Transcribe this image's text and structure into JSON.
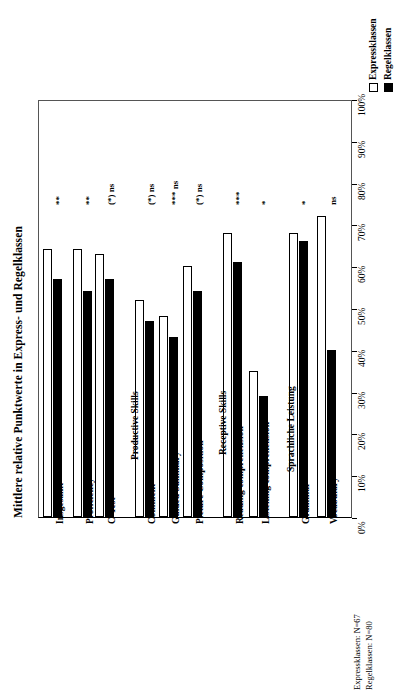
{
  "chart_data": {
    "type": "bar",
    "title": "",
    "ylabel": "Mittlere relative Punktwerte in Express- und Regelklassen",
    "xlabel": "",
    "orientation": "vertical-rotated",
    "ylim": [
      0,
      100
    ],
    "grid": false,
    "tick_labels": [
      "0%",
      "10%",
      "20%",
      "30%",
      "40%",
      "50%",
      "60%",
      "70%",
      "80%",
      "90%",
      "100%"
    ],
    "legend_position": "top-right",
    "categories": [
      "Insgesamt",
      "Proficiency",
      "C-Test",
      "Comment",
      "Guided Summary",
      "Picture Composition",
      "Reading comprehension",
      "Listening comprehension",
      "Grammar",
      "Vocabulary"
    ],
    "series": [
      {
        "name": "Expressklassen",
        "color": "#ffffff",
        "values": [
          64,
          64,
          63,
          52,
          48,
          60,
          68,
          35,
          68,
          72
        ]
      },
      {
        "name": "Regelklassen",
        "color": "#000000",
        "values": [
          57,
          54,
          57,
          47,
          43,
          54,
          61,
          29,
          66,
          40
        ]
      }
    ],
    "annotations": [
      "**",
      "**",
      "(*) ns",
      "(*) ns",
      "*** ns",
      "(*) ns",
      "***",
      "*",
      "*",
      "ns",
      "*"
    ],
    "group_headers": [
      "Productive Skills",
      "Receptive Skills",
      "Sprachliche Leistung"
    ],
    "footnotes": [
      "Expressklassen: N=67",
      "Regelklassen: N=80"
    ]
  },
  "legend": {
    "items": [
      {
        "label": "Expressklassen",
        "swatch": "hollow"
      },
      {
        "label": "Regelklassen",
        "swatch": "filled"
      }
    ]
  },
  "axis": {
    "title": "Mittlere relative Punktwerte in Express- und Regelklassen",
    "ticks": [
      "0%",
      "10%",
      "20%",
      "30%",
      "40%",
      "50%",
      "60%",
      "70%",
      "80%",
      "90%",
      "100%"
    ]
  },
  "categories": [
    {
      "label": "Insgesamt",
      "express": 64,
      "regel": 57,
      "sig": "**"
    },
    {
      "label": "Proficiency",
      "express": 64,
      "regel": 54,
      "sig": "**"
    },
    {
      "label": "C-Test",
      "express": 63,
      "regel": 57,
      "sig": "(*) ns"
    },
    {
      "label": "Comment",
      "express": 52,
      "regel": 47,
      "sig": "(*) ns"
    },
    {
      "label": "Guided Summary",
      "express": 48,
      "regel": 43,
      "sig": "*** ns"
    },
    {
      "label": "Picture Composition",
      "express": 60,
      "regel": 54,
      "sig": "(*) ns"
    },
    {
      "label": "Reading comprehension",
      "express": 68,
      "regel": 61,
      "sig": "***"
    },
    {
      "label": "Listening comprehension",
      "express": 35,
      "regel": 29,
      "sig": "*"
    },
    {
      "label": "Grammar",
      "express": 68,
      "regel": 66,
      "sig": "*"
    },
    {
      "label": "Vocabulary",
      "express": 72,
      "regel": 40,
      "sig": "ns"
    }
  ],
  "groups": [
    {
      "label": "Productive Skills"
    },
    {
      "label": "Receptive Skills"
    },
    {
      "label": "Sprachliche Leistung"
    }
  ],
  "footnotes": [
    {
      "text": "Expressklassen: N=67"
    },
    {
      "text": "Regelklassen: N=80"
    }
  ]
}
